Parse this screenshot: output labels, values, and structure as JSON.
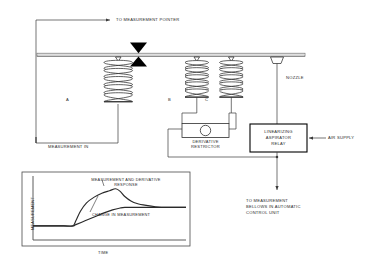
{
  "diagram": {
    "labels": {
      "to_measurement_pointer": "TO MEASUREMENT POINTER",
      "measurement_in": "MEASUREMENT IN",
      "nozzle": "NOZZLE",
      "derivative_restrictor_line1": "DERIVATIVE",
      "derivative_restrictor_line2": "RESTRICTOR",
      "relay_line1": "LINEARIZING",
      "relay_line2": "ASPIRATOR",
      "relay_line3": "RELAY",
      "air_supply": "AIR SUPPLY",
      "output_line1": "TO MEASUREMENT",
      "output_line2": "BELLOWS IN AUTOMATIC",
      "output_line3": "CONTROL UNIT"
    },
    "bellows": [
      {
        "id": "A",
        "label": "A"
      },
      {
        "id": "B",
        "label": "B"
      },
      {
        "id": "C",
        "label": "C"
      }
    ],
    "colors": {
      "line": "#3a3a3a",
      "beam": "#cfcfcf",
      "beam_edge": "#555555",
      "pivot": "#000000",
      "box_edge": "#000000",
      "text": "#2b2b2b",
      "curve": "#2a2a2a",
      "chart_frame": "#4a4a4a"
    }
  },
  "chart_data": {
    "type": "line",
    "title": "",
    "xlabel": "TIME",
    "ylabel": "MEASUREMENT",
    "grid": false,
    "legend": "inline-annotations",
    "xlim": [
      0,
      100
    ],
    "ylim": [
      0,
      100
    ],
    "annotations": [
      {
        "text_line1": "MEASUREMENT AND DERIVATIVE",
        "text_line2": "RESPONSE",
        "target_series": "measurement_and_derivative_response"
      },
      {
        "text_line1": "CHANGE IN MEASUREMENT",
        "text_line2": "",
        "target_series": "change_in_measurement"
      }
    ],
    "series": [
      {
        "name": "measurement_and_derivative_response",
        "label": "MEASUREMENT AND DERIVATIVE RESPONSE",
        "x": [
          0,
          10,
          20,
          26,
          28,
          31,
          35,
          40,
          45,
          50,
          54,
          57,
          60,
          64,
          68,
          74,
          80,
          88,
          100
        ],
        "y": [
          22,
          22,
          22,
          22,
          30,
          45,
          58,
          67,
          73,
          77,
          80,
          76,
          68,
          61,
          57,
          54,
          52,
          51,
          51
        ]
      },
      {
        "name": "change_in_measurement",
        "label": "CHANGE IN MEASUREMENT",
        "x": [
          0,
          10,
          20,
          26,
          28,
          34,
          40,
          46,
          52,
          57,
          60,
          66,
          74,
          84,
          100
        ],
        "y": [
          22,
          22,
          22,
          22,
          24,
          30,
          36,
          42,
          47,
          50,
          51,
          51,
          51,
          51,
          51
        ]
      }
    ]
  }
}
